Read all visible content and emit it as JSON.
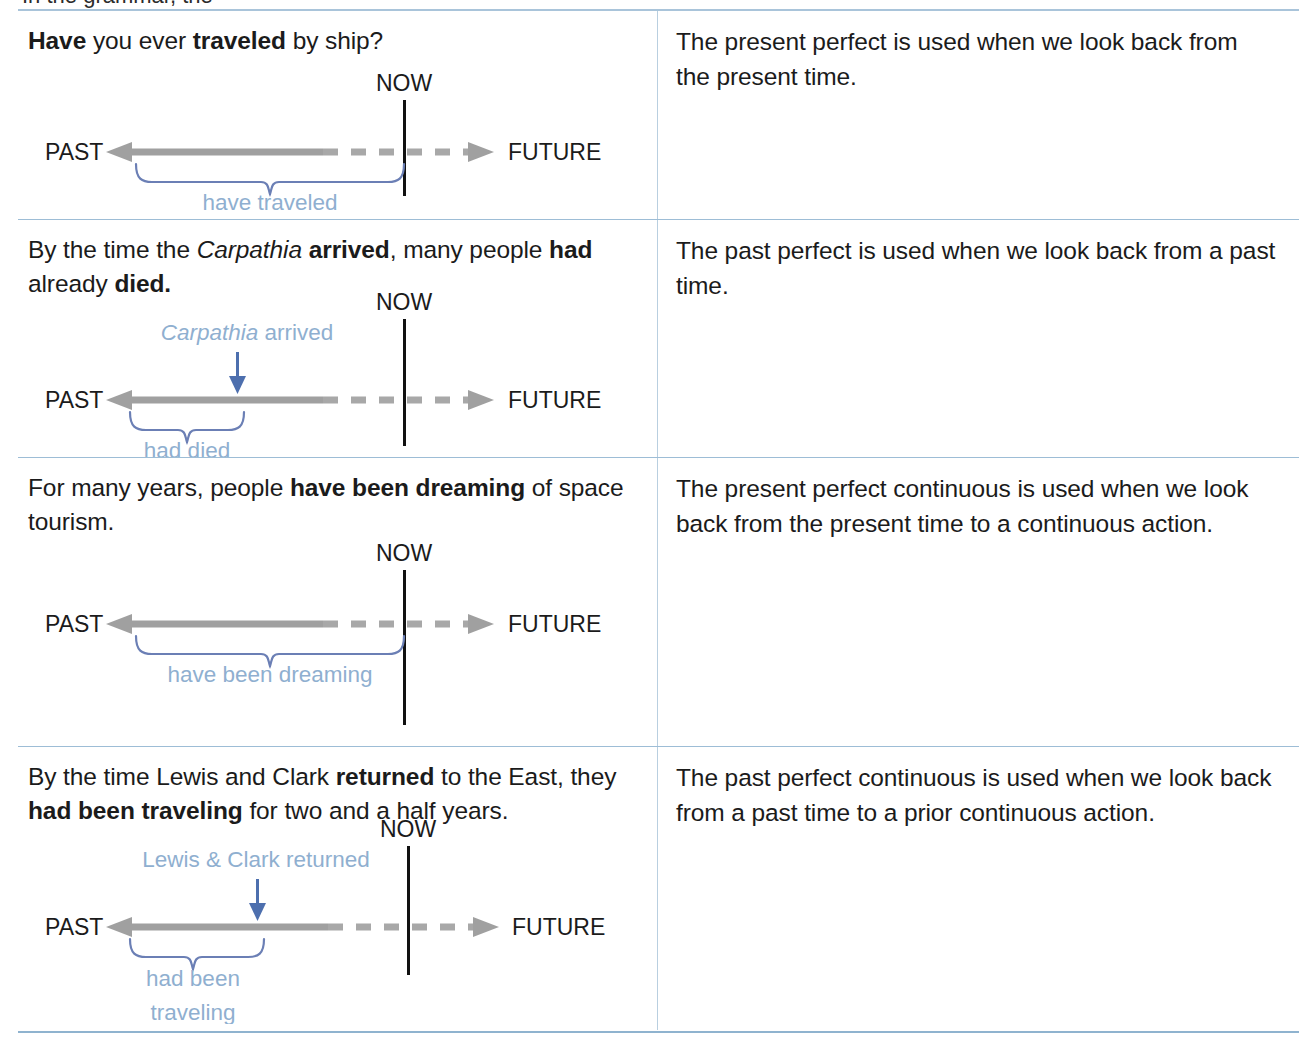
{
  "page": {
    "top_cut_text": "In the grammar, the",
    "accent_rule_color": "#9dbdd6",
    "timeline_gray": "#9e9e9e",
    "brace_blue": "#6b7fb5",
    "label_blue": "#8fafd0",
    "arrow_blue": "#4d6fae",
    "text_black": "#1b1b1b"
  },
  "labels": {
    "past": "PAST",
    "future": "FUTURE",
    "now": "NOW"
  },
  "rows": [
    {
      "id": "present-perfect",
      "example": {
        "segments": [
          {
            "text": "Have",
            "style": "bold"
          },
          {
            "text": " you ever ",
            "style": "normal"
          },
          {
            "text": "traveled",
            "style": "bold"
          },
          {
            "text": " by ship?",
            "style": "normal"
          }
        ],
        "plain": "Have you ever traveled by ship?"
      },
      "explanation": "The present perfect is used when we look back from the present time.",
      "diagram": {
        "brace_label": "have traveled",
        "brace_label_lines": [
          "have traveled"
        ],
        "event_marker": null,
        "event_label": null
      }
    },
    {
      "id": "past-perfect",
      "example": {
        "segments": [
          {
            "text": "By the time the ",
            "style": "normal"
          },
          {
            "text": "Carpathia",
            "style": "italic"
          },
          {
            "text": " ",
            "style": "normal"
          },
          {
            "text": "arrived",
            "style": "bold"
          },
          {
            "text": ", many people ",
            "style": "normal"
          },
          {
            "text": "had",
            "style": "bold"
          },
          {
            "text": " already ",
            "style": "normal"
          },
          {
            "text": "died",
            "style": "bold"
          },
          {
            "text": ".",
            "style": "normal"
          }
        ],
        "plain": "By the time the Carpathia arrived, many people had already died."
      },
      "explanation": "The past perfect is used when we look back from a past time.",
      "diagram": {
        "brace_label": "had died",
        "brace_label_lines": [
          "had died"
        ],
        "event_marker": "down-arrow",
        "event_label": "Carpathia arrived",
        "event_label_segments": [
          {
            "text": "Carpathia",
            "style": "italic"
          },
          {
            "text": " arrived",
            "style": "normal"
          }
        ]
      }
    },
    {
      "id": "present-perfect-continuous",
      "example": {
        "segments": [
          {
            "text": "For many years, people ",
            "style": "normal"
          },
          {
            "text": "have been dreaming",
            "style": "bold"
          },
          {
            "text": " of space tourism.",
            "style": "normal"
          }
        ],
        "plain": "For many years, people have been dreaming of space tourism."
      },
      "explanation": "The present perfect continuous is used when we look back from the present time to a continuous action.",
      "diagram": {
        "brace_label": "have been dreaming",
        "brace_label_lines": [
          "have been dreaming"
        ],
        "event_marker": null,
        "event_label": null
      }
    },
    {
      "id": "past-perfect-continuous",
      "example": {
        "segments": [
          {
            "text": "By the time Lewis and Clark ",
            "style": "normal"
          },
          {
            "text": "returned",
            "style": "bold"
          },
          {
            "text": " to the East, they ",
            "style": "normal"
          },
          {
            "text": "had been traveling",
            "style": "bold"
          },
          {
            "text": " for two and a half years.",
            "style": "normal"
          }
        ],
        "plain": "By the time Lewis and Clark returned to the East, they had been traveling for two and a half years."
      },
      "explanation": "The past perfect continuous is used when we look back from a past time to a prior continuous action.",
      "diagram": {
        "brace_label": "had been traveling",
        "brace_label_lines": [
          "had been",
          "traveling"
        ],
        "event_marker": "down-arrow",
        "event_label": "Lewis & Clark returned",
        "event_label_segments": [
          {
            "text": "Lewis & Clark returned",
            "style": "normal"
          }
        ]
      }
    }
  ]
}
